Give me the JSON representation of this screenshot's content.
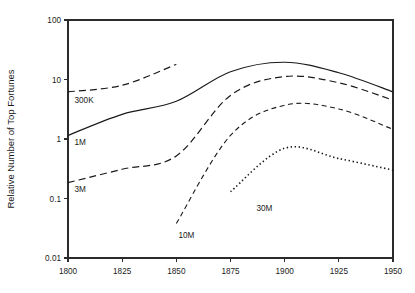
{
  "chart_data": {
    "type": "line",
    "title": "",
    "subtitle": "",
    "xlabel": "",
    "ylabel": "Relative Number of Top Fortunes",
    "x_ticks": [
      "1800",
      "1825",
      "1850",
      "1875",
      "1900",
      "1925",
      "1950"
    ],
    "x_tick_values": [
      1800,
      1825,
      1850,
      1875,
      1900,
      1925,
      1950
    ],
    "xlim": [
      1800,
      1950
    ],
    "y_ticks": [
      "0.01",
      "0.1",
      "1",
      "10",
      "100"
    ],
    "y_tick_values": [
      0.01,
      0.1,
      1,
      10,
      100
    ],
    "ylim": [
      0.01,
      100
    ],
    "y_scale": "log",
    "grid": false,
    "legend_position": "inline-labels",
    "series": [
      {
        "name": "300K",
        "label": "300K",
        "line_style": "long-dash",
        "dash_array": "7,4",
        "stroke_width": 1.2,
        "x": [
          1800,
          1825,
          1850
        ],
        "values": [
          6.2,
          8.0,
          18.0
        ],
        "label_x": 1803,
        "label_y": 4.1
      },
      {
        "name": "1M",
        "label": "1M",
        "line_style": "solid",
        "dash_array": "none",
        "stroke_width": 1.2,
        "x": [
          1800,
          1825,
          1850,
          1875,
          1900,
          1925,
          1950
        ],
        "values": [
          1.15,
          2.6,
          4.3,
          13.5,
          19.5,
          13.0,
          6.2
        ],
        "label_x": 1803,
        "label_y": 0.8
      },
      {
        "name": "3M",
        "label": "3M",
        "line_style": "long-dash",
        "dash_array": "7,4",
        "stroke_width": 1.2,
        "x": [
          1800,
          1825,
          1850,
          1875,
          1900,
          1925,
          1950
        ],
        "values": [
          0.185,
          0.31,
          0.52,
          5.4,
          11.2,
          8.8,
          4.5
        ],
        "label_x": 1803,
        "label_y": 0.13
      },
      {
        "name": "10M",
        "label": "10M",
        "line_style": "medium-dash",
        "dash_array": "5,3.5",
        "stroke_width": 1.1,
        "x": [
          1850,
          1875,
          1900,
          1925,
          1950
        ],
        "values": [
          0.038,
          1.15,
          3.7,
          3.2,
          1.45
        ],
        "label_x": 1851,
        "label_y": 0.022
      },
      {
        "name": "30M",
        "label": "30M",
        "line_style": "dotted",
        "dash_array": "1.4,2.6",
        "stroke_width": 1.6,
        "x": [
          1875,
          1900,
          1925,
          1950
        ],
        "values": [
          0.13,
          0.7,
          0.47,
          0.3
        ],
        "label_x": 1887,
        "label_y": 0.062
      }
    ]
  },
  "plot": {
    "left": 68,
    "right": 393,
    "top": 20,
    "bottom": 258
  }
}
